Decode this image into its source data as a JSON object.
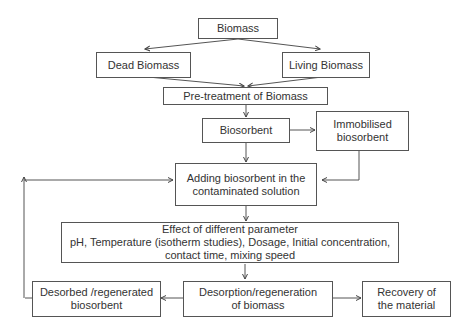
{
  "diagram": {
    "nodes": {
      "biomass": {
        "lines": [
          "Biomass"
        ]
      },
      "dead_biomass": {
        "lines": [
          "Dead Biomass"
        ]
      },
      "living_biomass": {
        "lines": [
          "Living Biomass"
        ]
      },
      "pretreatment": {
        "lines": [
          "Pre-treatment of Biomass"
        ]
      },
      "biosorbent": {
        "lines": [
          "Biosorbent"
        ]
      },
      "immobilised": {
        "lines": [
          "Immobilised",
          "biosorbent"
        ]
      },
      "adding": {
        "lines": [
          "Adding biosorbent in the",
          "contaminated solution"
        ]
      },
      "effect": {
        "lines": [
          "Effect  of different parameter",
          "pH, Temperature (isotherm studies), Dosage, Initial concentration,",
          "contact time, mixing speed"
        ]
      },
      "desorbed": {
        "lines": [
          "Desorbed /regenerated",
          "biosorbent"
        ]
      },
      "desorption": {
        "lines": [
          "Desorption/regeneration",
          "of biomass"
        ]
      },
      "recovery": {
        "lines": [
          "Recovery  of",
          "the material"
        ]
      }
    },
    "edges": [
      {
        "from": "Biomass",
        "to": "Dead Biomass"
      },
      {
        "from": "Biomass",
        "to": "Living Biomass"
      },
      {
        "from": "Dead Biomass",
        "to": "Pre-treatment of Biomass"
      },
      {
        "from": "Living Biomass",
        "to": "Pre-treatment of Biomass"
      },
      {
        "from": "Pre-treatment of Biomass",
        "to": "Biosorbent"
      },
      {
        "from": "Biosorbent",
        "to": "Immobilised biosorbent"
      },
      {
        "from": "Biosorbent",
        "to": "Adding biosorbent in the contaminated solution"
      },
      {
        "from": "Immobilised biosorbent",
        "to": "Adding biosorbent in the contaminated solution"
      },
      {
        "from": "Adding biosorbent in the contaminated solution",
        "to": "Effect of different parameter"
      },
      {
        "from": "Effect of different parameter",
        "to": "Desorption/regeneration of biomass"
      },
      {
        "from": "Desorption/regeneration of biomass",
        "to": "Desorbed /regenerated biosorbent"
      },
      {
        "from": "Desorption/regeneration of biomass",
        "to": "Recovery of the material"
      },
      {
        "from": "Desorbed /regenerated biosorbent",
        "to": "Adding biosorbent in the contaminated solution"
      }
    ],
    "colors": {
      "line": "#555555",
      "text": "#333333",
      "background": "#ffffff"
    }
  }
}
